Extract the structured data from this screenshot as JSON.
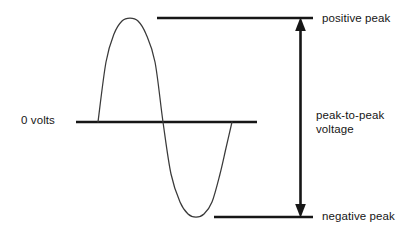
{
  "diagram": {
    "background_color": "#ffffff",
    "stroke_color": "#161616",
    "curve_color": "#3a3a3a",
    "labels": {
      "zero_volts": "0 volts",
      "positive_peak": "positive peak",
      "peak_to_peak_line1": "peak-to-peak",
      "peak_to_peak_line2": "voltage",
      "negative_peak": "negative peak"
    },
    "geometry": {
      "zero_line_y": 122,
      "zero_line_x1": 76,
      "zero_line_x2": 257,
      "positive_peak_line_y": 18,
      "positive_peak_line_x1": 157,
      "positive_peak_line_x2": 313,
      "negative_peak_line_y": 217,
      "negative_peak_line_x1": 214,
      "negative_peak_line_x2": 313,
      "arrow_x": 300,
      "arrow_top_y": 18,
      "arrow_bottom_y": 217,
      "wave_start_x": 98,
      "wave_crest_x": 130,
      "wave_zero_crossing_x": 163,
      "wave_trough_x": 196,
      "wave_end_x": 232
    }
  },
  "chart_data": {
    "type": "line",
    "xlabel": "",
    "ylabel": "Voltage",
    "grid": false,
    "legend_position": "right",
    "series": [
      {
        "name": "sine waveform",
        "x": [
          98,
          106,
          114,
          122,
          130,
          138,
          146,
          155,
          163,
          171,
          180,
          188,
          196,
          204,
          212,
          220,
          226,
          232
        ],
        "y": [
          122,
          62,
          34,
          21,
          18,
          21,
          34,
          62,
          122,
          174,
          202,
          214,
          217,
          214,
          202,
          174,
          148,
          122
        ]
      }
    ],
    "reference_lines": [
      {
        "name": "positive peak",
        "value": 18,
        "label": "positive peak"
      },
      {
        "name": "zero volts",
        "value": 122,
        "label": "0 volts"
      },
      {
        "name": "negative peak",
        "value": 217,
        "label": "negative peak"
      }
    ],
    "annotations": [
      {
        "name": "peak-to-peak voltage",
        "text": "peak-to-peak voltage",
        "from": 18,
        "to": 217,
        "double_headed": true
      }
    ]
  }
}
